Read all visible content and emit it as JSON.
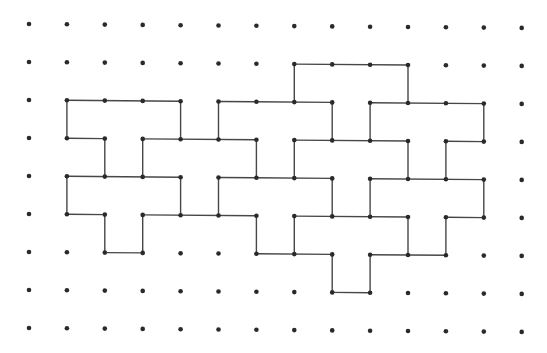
{
  "figure": {
    "type": "dot-grid-polyomino-outline",
    "grid": {
      "cols": 14,
      "rows": 9,
      "origin_x": 29,
      "origin_y": 24,
      "spacing_x": 37.9,
      "spacing_y": 38,
      "skew_y_per_col": 0.3,
      "dot_radius": 2.3
    },
    "colors": {
      "background": "#ffffff",
      "dot": "#2a2a2a",
      "line": "#474747"
    },
    "line_width": 1.4,
    "horizontal_edges": [
      {
        "row": 1,
        "from": 7,
        "to": 10
      },
      {
        "row": 2,
        "from": 1,
        "to": 4
      },
      {
        "row": 2,
        "from": 5,
        "to": 8
      },
      {
        "row": 2,
        "from": 9,
        "to": 12
      },
      {
        "row": 3,
        "from": 1,
        "to": 2
      },
      {
        "row": 3,
        "from": 3,
        "to": 6
      },
      {
        "row": 3,
        "from": 7,
        "to": 10
      },
      {
        "row": 3,
        "from": 11,
        "to": 12
      },
      {
        "row": 4,
        "from": 1,
        "to": 4
      },
      {
        "row": 4,
        "from": 5,
        "to": 8
      },
      {
        "row": 4,
        "from": 9,
        "to": 12
      },
      {
        "row": 5,
        "from": 1,
        "to": 2
      },
      {
        "row": 5,
        "from": 3,
        "to": 6
      },
      {
        "row": 5,
        "from": 7,
        "to": 10
      },
      {
        "row": 5,
        "from": 11,
        "to": 12
      },
      {
        "row": 6,
        "from": 2,
        "to": 3
      },
      {
        "row": 6,
        "from": 6,
        "to": 8
      },
      {
        "row": 6,
        "from": 9,
        "to": 11
      },
      {
        "row": 7,
        "from": 8,
        "to": 9
      }
    ],
    "vertical_edges": [
      {
        "col": 1,
        "from": 2,
        "to": 3
      },
      {
        "col": 1,
        "from": 4,
        "to": 5
      },
      {
        "col": 2,
        "from": 3,
        "to": 4
      },
      {
        "col": 2,
        "from": 5,
        "to": 6
      },
      {
        "col": 3,
        "from": 3,
        "to": 4
      },
      {
        "col": 3,
        "from": 5,
        "to": 6
      },
      {
        "col": 4,
        "from": 2,
        "to": 3
      },
      {
        "col": 4,
        "from": 4,
        "to": 5
      },
      {
        "col": 5,
        "from": 2,
        "to": 3
      },
      {
        "col": 5,
        "from": 4,
        "to": 5
      },
      {
        "col": 6,
        "from": 3,
        "to": 4
      },
      {
        "col": 6,
        "from": 5,
        "to": 6
      },
      {
        "col": 7,
        "from": 1,
        "to": 2
      },
      {
        "col": 7,
        "from": 3,
        "to": 4
      },
      {
        "col": 7,
        "from": 5,
        "to": 6
      },
      {
        "col": 8,
        "from": 2,
        "to": 3
      },
      {
        "col": 8,
        "from": 4,
        "to": 5
      },
      {
        "col": 8,
        "from": 6,
        "to": 7
      },
      {
        "col": 9,
        "from": 2,
        "to": 3
      },
      {
        "col": 9,
        "from": 4,
        "to": 5
      },
      {
        "col": 9,
        "from": 6,
        "to": 7
      },
      {
        "col": 10,
        "from": 1,
        "to": 2
      },
      {
        "col": 10,
        "from": 3,
        "to": 4
      },
      {
        "col": 10,
        "from": 5,
        "to": 6
      },
      {
        "col": 11,
        "from": 3,
        "to": 4
      },
      {
        "col": 11,
        "from": 5,
        "to": 6
      },
      {
        "col": 12,
        "from": 2,
        "to": 3
      },
      {
        "col": 12,
        "from": 4,
        "to": 5
      }
    ]
  }
}
